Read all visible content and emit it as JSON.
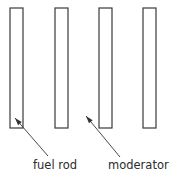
{
  "diagram": {
    "background_color": "#ffffff",
    "stroke_color": "#3a3a3a",
    "text_color": "#2b2b2b",
    "rods": [
      {
        "name": "rod-1",
        "x": 10,
        "y": 8,
        "width": 13,
        "height": 120
      },
      {
        "name": "rod-2",
        "x": 55,
        "y": 8,
        "width": 13,
        "height": 120
      },
      {
        "name": "rod-3",
        "x": 99,
        "y": 8,
        "width": 13,
        "height": 120
      },
      {
        "name": "rod-4",
        "x": 143,
        "y": 8,
        "width": 13,
        "height": 120
      }
    ],
    "labels": [
      {
        "id": "fuel-rod",
        "text": "fuel rod",
        "text_x": 33,
        "text_y": 169,
        "line_from_x": 48,
        "line_from_y": 156,
        "line_to_x": 15,
        "line_to_y": 118,
        "arrow_angle_deg": 229
      },
      {
        "id": "moderator",
        "text": "moderator",
        "text_x": 108,
        "text_y": 169,
        "line_from_x": 120,
        "line_from_y": 157,
        "line_to_x": 86,
        "line_to_y": 116,
        "arrow_angle_deg": 230
      }
    ]
  }
}
